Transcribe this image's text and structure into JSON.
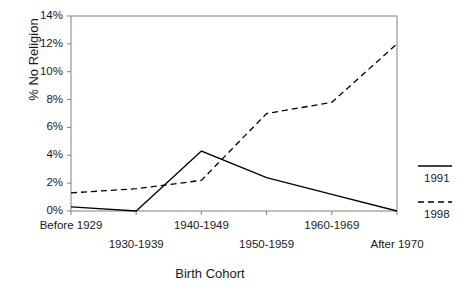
{
  "chart_data": {
    "type": "line",
    "title": "",
    "xlabel": "Birth Cohort",
    "ylabel": "% No Religion",
    "categories": [
      "Before 1929",
      "1930-1939",
      "1940-1949",
      "1950-1959",
      "1960-1969",
      "After 1970"
    ],
    "series": [
      {
        "name": "1991",
        "style": "solid",
        "values": [
          0.3,
          0.0,
          4.3,
          2.4,
          1.2,
          0.0
        ]
      },
      {
        "name": "1998",
        "style": "dashed",
        "values": [
          1.3,
          1.6,
          2.2,
          7.0,
          7.8,
          12.0
        ]
      }
    ],
    "ylim": [
      0,
      14
    ],
    "yticks": [
      "0%",
      "2%",
      "4%",
      "6%",
      "8%",
      "10%",
      "12%",
      "14%"
    ],
    "ytick_values": [
      0,
      2,
      4,
      6,
      8,
      10,
      12,
      14
    ],
    "grid": false,
    "legend_position": "right",
    "colors": {
      "line": "#000000",
      "axis": "#808080",
      "text": "#1a1a1a"
    }
  },
  "axis": {
    "ylabel": "% No Religion",
    "xlabel": "Birth Cohort"
  },
  "legend": {
    "items": [
      {
        "label": "1991",
        "style": "solid"
      },
      {
        "label": "1998",
        "style": "dashed"
      }
    ]
  }
}
